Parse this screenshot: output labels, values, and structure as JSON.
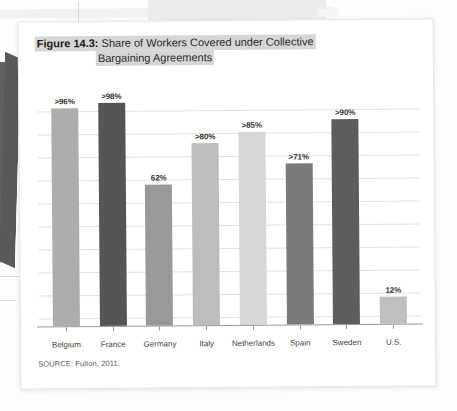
{
  "background": {
    "description": "faint pages behind the figure card"
  },
  "figure": {
    "title_prefix": "Figure 14.3:",
    "title_line1": " Share of Workers Covered under Collective",
    "title_line2": "Bargaining Agreements",
    "source": "SOURCE: Fulton, 2011."
  },
  "chart_data": {
    "type": "bar",
    "title": "Figure 14.3: Share of Workers Covered under Collective Bargaining Agreements",
    "xlabel": "",
    "ylabel": "",
    "ylim": [
      0,
      100
    ],
    "grid": true,
    "gridline_count": 10,
    "legend": "none",
    "categories": [
      "Belgium",
      "France",
      "Germany",
      "Italy",
      "Netherlands",
      "Spain",
      "Sweden",
      "U.S."
    ],
    "values": [
      96,
      98,
      62,
      80,
      85,
      71,
      90,
      12
    ],
    "labels": [
      ">96%",
      ">98%",
      "62%",
      ">80%",
      ">85%",
      ">71%",
      ">90%",
      "12%"
    ],
    "colors": [
      "#adadad",
      "#555555",
      "#999999",
      "#bdbdbd",
      "#d7d7d7",
      "#7b7b7b",
      "#5d5d5d",
      "#bfbfbf"
    ],
    "source": "SOURCE: Fulton, 2011."
  }
}
